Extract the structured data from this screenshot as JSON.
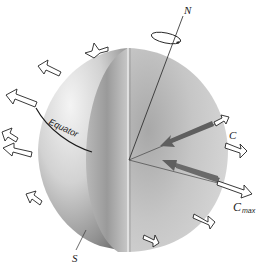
{
  "figure": {
    "type": "diagram",
    "labels": {
      "north": "N",
      "south": "S",
      "equator": "Equator",
      "c": "C",
      "c_max_main": "C",
      "c_max_sub": "max"
    },
    "colors": {
      "background": "#ffffff",
      "sphere_light": "#ededed",
      "sphere_mid": "#c4c4c4",
      "sphere_dark": "#8a8a8a",
      "force_arrow": "#6d6d6d",
      "outline": "#222222"
    },
    "arrows": {
      "outward_count": 11,
      "force_vectors": [
        "C",
        "Cmax"
      ]
    }
  }
}
